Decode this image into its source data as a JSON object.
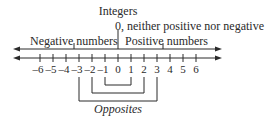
{
  "diagram": {
    "title": "Integers",
    "zero_label": "0, neither positive nor negative",
    "negative_label": "Negative numbers",
    "positive_label": "Positive numbers",
    "opposites_label": "Opposites",
    "ticks": [
      "–6",
      "–5",
      "–4",
      "–3",
      "–2",
      "–1",
      "0",
      "1",
      "2",
      "3",
      "4",
      "5",
      "6"
    ],
    "opposite_pairs": [
      [
        -1,
        1
      ],
      [
        -2,
        2
      ],
      [
        -3,
        3
      ]
    ],
    "line_color": "#2a2a2a"
  }
}
